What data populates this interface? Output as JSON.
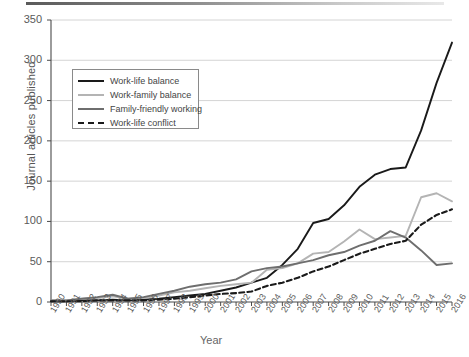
{
  "chart_data": {
    "type": "line",
    "title": "",
    "xlabel": "Year",
    "ylabel": "Journal articles published",
    "ylim": [
      0,
      350
    ],
    "yticks": [
      0,
      50,
      100,
      150,
      200,
      250,
      300,
      350
    ],
    "grid": "horizontal",
    "legend_position": "upper-left-inside",
    "categories": [
      "1990",
      "1991",
      "1992",
      "1993",
      "1994",
      "1995",
      "1996",
      "1997",
      "1998",
      "1999",
      "2000",
      "2001",
      "2002",
      "2003",
      "2004",
      "2005",
      "2006",
      "2007",
      "2008",
      "2009",
      "2010",
      "2011",
      "2012",
      "2013",
      "2014",
      "2015",
      "2016"
    ],
    "series": [
      {
        "name": "Work-life balance",
        "color": "#1a1a1a",
        "style": "solid",
        "values": [
          1,
          1,
          2,
          2,
          3,
          2,
          3,
          4,
          6,
          8,
          10,
          14,
          18,
          24,
          30,
          46,
          66,
          98,
          103,
          120,
          143,
          158,
          165,
          167,
          213,
          272,
          322
        ]
      },
      {
        "name": "Work-family balance",
        "color": "#b4b4b4",
        "style": "solid",
        "values": [
          2,
          2,
          4,
          5,
          7,
          4,
          5,
          8,
          12,
          14,
          17,
          20,
          22,
          24,
          40,
          42,
          48,
          60,
          62,
          75,
          90,
          78,
          80,
          82,
          130,
          135,
          125
        ]
      },
      {
        "name": "Family-friendly working",
        "color": "#6e6e6e",
        "style": "solid",
        "values": [
          2,
          2,
          4,
          6,
          9,
          4,
          6,
          10,
          14,
          19,
          22,
          24,
          28,
          38,
          42,
          44,
          48,
          52,
          58,
          62,
          70,
          76,
          88,
          80,
          64,
          46,
          48
        ]
      },
      {
        "name": "Work-life conflict",
        "color": "#1a1a1a",
        "style": "dashed",
        "values": [
          1,
          1,
          1,
          2,
          2,
          2,
          2,
          3,
          4,
          6,
          8,
          10,
          11,
          13,
          20,
          24,
          30,
          38,
          44,
          52,
          60,
          66,
          72,
          76,
          96,
          108,
          115
        ]
      }
    ]
  },
  "axes": {
    "yticks_labels": [
      "0",
      "50",
      "100",
      "150",
      "200",
      "250",
      "300",
      "350"
    ],
    "ylabel_text": "Journal articles published",
    "xlabel_text": "Year"
  },
  "legend": {
    "items": [
      {
        "label": "Work-life balance"
      },
      {
        "label": "Work-family balance"
      },
      {
        "label": "Family-friendly working"
      },
      {
        "label": "Work-life conflict"
      }
    ]
  }
}
